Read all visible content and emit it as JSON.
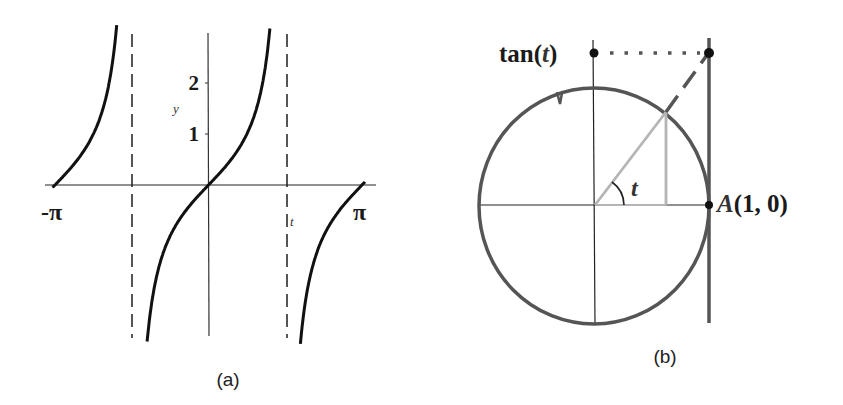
{
  "figure_a": {
    "caption": "(a)",
    "x_axis_label": "t",
    "y_axis_label": "y",
    "x_tick_labels": {
      "left": "-π",
      "right": "π"
    },
    "y_tick_labels": [
      "1",
      "2"
    ],
    "function": "tan(t)",
    "asymptotes": [
      "-π/2",
      "π/2"
    ]
  },
  "figure_b": {
    "caption": "(b)",
    "tan_label_prefix": "tan",
    "tan_label_arg": "t",
    "angle_label": "t",
    "point_label_letter": "A",
    "point_label_coords": "(1, 0)"
  },
  "colors": {
    "curve": "#111111",
    "axis": "#222222",
    "asymptote": "#555555",
    "circle": "#555555",
    "triangle": "#b5b5b5",
    "tangent_line": "#555555"
  },
  "chart_data": {
    "type": "line",
    "title": "",
    "xlabel": "t",
    "ylabel": "y",
    "xlim": [
      -3.1416,
      3.1416
    ],
    "ylim": [
      -3,
      3
    ],
    "x_ticks": [
      {
        "value": -3.1416,
        "label": "-π"
      },
      {
        "value": 3.1416,
        "label": "π"
      }
    ],
    "y_ticks": [
      {
        "value": 1,
        "label": "1"
      },
      {
        "value": 2,
        "label": "2"
      }
    ],
    "series": [
      {
        "name": "tan(t)",
        "function": "tan(t)"
      }
    ],
    "asymptotes_x": [
      -1.5708,
      1.5708
    ]
  }
}
